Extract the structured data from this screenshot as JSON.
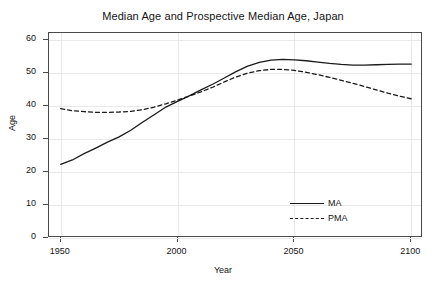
{
  "chart_data": {
    "type": "line",
    "title": "Median Age and Prospective Median Age, Japan",
    "xlabel": "Year",
    "ylabel": "Age",
    "xlim": [
      1945,
      2105
    ],
    "ylim": [
      0,
      62
    ],
    "xticks": [
      1950,
      2000,
      2050,
      2100
    ],
    "yticks": [
      0,
      10,
      20,
      30,
      40,
      50,
      60
    ],
    "xtick_labels": [
      "1950",
      "2000",
      "2050",
      "2100"
    ],
    "ytick_labels": [
      "0",
      "10",
      "20",
      "30",
      "40",
      "50",
      "60"
    ],
    "grid": true,
    "legend_position": "bottom-right-inside",
    "x": [
      1950,
      1955,
      1960,
      1965,
      1970,
      1975,
      1980,
      1985,
      1990,
      1995,
      2000,
      2005,
      2010,
      2015,
      2020,
      2025,
      2030,
      2035,
      2040,
      2045,
      2050,
      2055,
      2060,
      2065,
      2070,
      2075,
      2080,
      2085,
      2090,
      2095,
      2100
    ],
    "series": [
      {
        "name": "MA",
        "label": "MA",
        "style": "solid",
        "color": "#1a1a1a",
        "values": [
          22.3,
          23.6,
          25.5,
          27.2,
          29.0,
          30.6,
          32.6,
          35.0,
          37.3,
          39.6,
          41.3,
          43.0,
          44.8,
          46.5,
          48.4,
          50.3,
          52.0,
          53.1,
          53.8,
          54.0,
          53.9,
          53.6,
          53.2,
          52.8,
          52.5,
          52.3,
          52.3,
          52.4,
          52.5,
          52.6,
          52.6
        ]
      },
      {
        "name": "PMA",
        "label": "PMA",
        "style": "dashed",
        "color": "#1a1a1a",
        "values": [
          39.1,
          38.5,
          38.2,
          38.0,
          38.0,
          38.1,
          38.3,
          38.8,
          39.6,
          40.6,
          41.7,
          42.9,
          44.2,
          45.6,
          47.2,
          48.7,
          49.9,
          50.6,
          51.0,
          51.0,
          50.7,
          50.1,
          49.4,
          48.6,
          47.7,
          46.8,
          45.8,
          44.8,
          43.8,
          42.9,
          42.1
        ]
      }
    ]
  },
  "legend": {
    "entries": [
      {
        "label": "MA",
        "style": "solid"
      },
      {
        "label": "PMA",
        "style": "dashed"
      }
    ]
  }
}
